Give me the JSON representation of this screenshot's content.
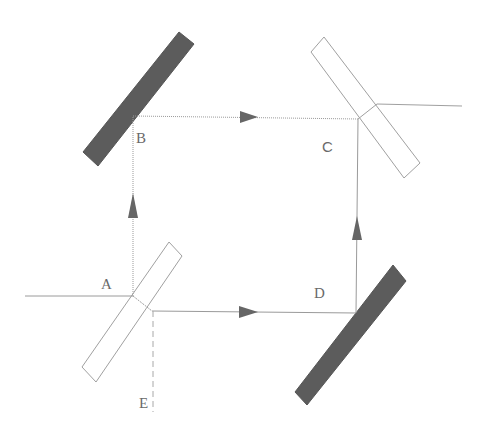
{
  "diagram": {
    "colors": {
      "background": "#ffffff",
      "mirror_fill": "#5c5c5c",
      "splitter_stroke": "#9a9a9a",
      "beam": "#9a9a9a",
      "arrow": "#666666",
      "label": "#6a6a6a"
    },
    "labels": {
      "A": "A",
      "B": "B",
      "C": "C",
      "D": "D",
      "E": "E"
    },
    "components": [
      {
        "id": "mirror-B",
        "type": "mirror",
        "at": "B"
      },
      {
        "id": "beam-splitter-C",
        "type": "beam-splitter",
        "at": "C"
      },
      {
        "id": "beam-splitter-A",
        "type": "beam-splitter",
        "at": "A"
      },
      {
        "id": "mirror-D",
        "type": "mirror",
        "at": "D"
      }
    ],
    "beams": [
      {
        "from": "input",
        "to": "A",
        "style": "solid"
      },
      {
        "from": "A",
        "to": "B",
        "style": "solid",
        "arrow": "up"
      },
      {
        "from": "B",
        "to": "C",
        "style": "solid",
        "arrow": "right"
      },
      {
        "from": "A",
        "to": "D",
        "style": "solid",
        "arrow": "right"
      },
      {
        "from": "D",
        "to": "C",
        "style": "solid",
        "arrow": "up"
      },
      {
        "from": "C",
        "to": "output",
        "style": "solid"
      },
      {
        "from": "A",
        "to": "E",
        "style": "dashed"
      }
    ]
  }
}
